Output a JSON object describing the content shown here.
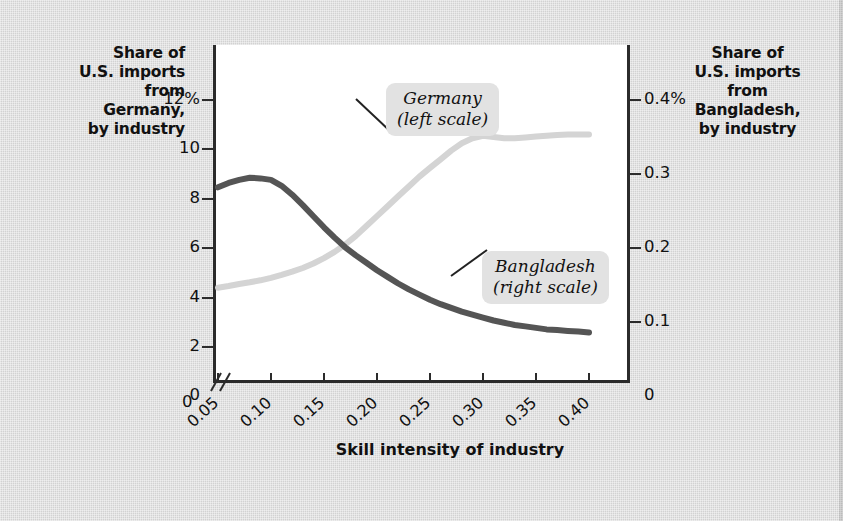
{
  "figure": {
    "background_color": "#d9d9d9",
    "plot_background_color": "#ffffff",
    "axis_color": "#2b2b2b"
  },
  "labels": {
    "left_axis_title": "Share of\nU.S. imports\nfrom\nGermany,\nby industry",
    "right_axis_title": "Share of\nU.S. imports\nfrom\nBangladesh,\nby industry",
    "x_axis_title": "Skill intensity of industry",
    "left_axis_title_lines": [
      "Share of",
      "U.S. imports",
      "from",
      "Germany,",
      "by industry"
    ],
    "right_axis_title_lines": [
      "Share of",
      "U.S. imports",
      "from",
      "Bangladesh,",
      "by industry"
    ]
  },
  "callouts": [
    {
      "id": "germany",
      "line1": "Germany",
      "line2": "(left scale)",
      "series": "Germany",
      "scale": "left"
    },
    {
      "id": "bangladesh",
      "line1": "Bangladesh",
      "line2": "(right scale)",
      "series": "Bangladesh",
      "scale": "right"
    }
  ],
  "axes": {
    "x_ticks": [
      "0.05",
      "0.10",
      "0.15",
      "0.20",
      "0.25",
      "0.30",
      "0.35",
      "0.40"
    ],
    "x_origin_label": "0",
    "x_break": true,
    "y_left_ticks": [
      "2",
      "4",
      "6",
      "8",
      "10",
      "12%"
    ],
    "y_left_zero": "0",
    "y_right_ticks": [
      "0.1",
      "0.2",
      "0.3",
      "0.4%"
    ],
    "y_right_zero": "0"
  },
  "chart_data": {
    "type": "line",
    "title": "",
    "xlabel": "Skill intensity of industry",
    "ylabel": "Share of U.S. imports from Germany, by industry",
    "ylabel_right": "Share of U.S. imports from Bangladesh, by industry",
    "xlim": [
      0.04,
      0.41
    ],
    "ylim_left": [
      0,
      12
    ],
    "ylim_right": [
      0,
      0.4
    ],
    "grid": false,
    "legend": "callout-annotations",
    "x": [
      0.05,
      0.06,
      0.07,
      0.08,
      0.09,
      0.1,
      0.11,
      0.12,
      0.13,
      0.14,
      0.15,
      0.16,
      0.17,
      0.18,
      0.19,
      0.2,
      0.21,
      0.22,
      0.23,
      0.24,
      0.25,
      0.26,
      0.27,
      0.28,
      0.29,
      0.3,
      0.31,
      0.32,
      0.33,
      0.34,
      0.35,
      0.36,
      0.37,
      0.38,
      0.39,
      0.4
    ],
    "series": [
      {
        "name": "Germany",
        "scale": "left",
        "unit": "%",
        "color": "#d4d4d4",
        "values": [
          4.4,
          4.47,
          4.55,
          4.62,
          4.7,
          4.8,
          4.92,
          5.05,
          5.2,
          5.38,
          5.6,
          5.85,
          6.15,
          6.5,
          6.9,
          7.3,
          7.7,
          8.1,
          8.5,
          8.9,
          9.25,
          9.6,
          9.95,
          10.25,
          10.45,
          10.55,
          10.5,
          10.45,
          10.45,
          10.48,
          10.52,
          10.55,
          10.58,
          10.6,
          10.6,
          10.6
        ]
      },
      {
        "name": "Bangladesh",
        "scale": "right",
        "unit": "%",
        "color": "#555555",
        "values": [
          0.282,
          0.288,
          0.292,
          0.295,
          0.294,
          0.292,
          0.284,
          0.272,
          0.258,
          0.243,
          0.228,
          0.214,
          0.201,
          0.19,
          0.18,
          0.17,
          0.161,
          0.152,
          0.144,
          0.137,
          0.13,
          0.124,
          0.119,
          0.114,
          0.11,
          0.106,
          0.102,
          0.099,
          0.096,
          0.094,
          0.092,
          0.09,
          0.089,
          0.088,
          0.087,
          0.086
        ]
      }
    ]
  }
}
